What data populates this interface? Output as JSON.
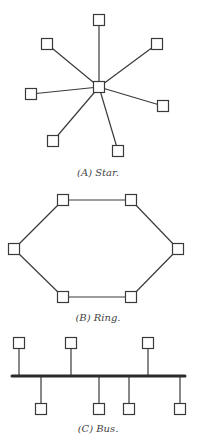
{
  "figures": [
    {
      "id": "star",
      "caption": "(A)  Star.",
      "hub": {
        "x": 99,
        "y": 87
      },
      "nodes": [
        {
          "x": 99,
          "y": 20
        },
        {
          "x": 47,
          "y": 44
        },
        {
          "x": 157,
          "y": 44
        },
        {
          "x": 31,
          "y": 94
        },
        {
          "x": 163,
          "y": 106
        },
        {
          "x": 53,
          "y": 141
        },
        {
          "x": 118,
          "y": 151
        }
      ]
    },
    {
      "id": "ring",
      "caption": "(B)  Ring.",
      "nodes": [
        {
          "x": 63,
          "y": 200
        },
        {
          "x": 131,
          "y": 200
        },
        {
          "x": 178,
          "y": 249
        },
        {
          "x": 131,
          "y": 297
        },
        {
          "x": 63,
          "y": 297
        },
        {
          "x": 14,
          "y": 249
        }
      ]
    },
    {
      "id": "bus",
      "caption": "(C)  Bus.",
      "bus_line": {
        "x1": 12,
        "x2": 185,
        "y": 376
      },
      "upper_nodes": [
        {
          "x": 19,
          "y": 343
        },
        {
          "x": 71,
          "y": 343
        },
        {
          "x": 148,
          "y": 343
        }
      ],
      "lower_nodes": [
        {
          "x": 41,
          "y": 409
        },
        {
          "x": 99,
          "y": 409
        },
        {
          "x": 129,
          "y": 409
        },
        {
          "x": 180,
          "y": 409
        }
      ]
    }
  ],
  "node_size": 11
}
